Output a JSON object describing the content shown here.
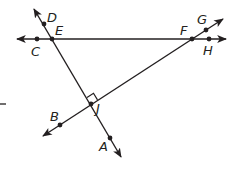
{
  "diagram": {
    "type": "geometry-lines",
    "colors": {
      "stroke": "#231f20",
      "background": "#ffffff"
    },
    "lines": [
      {
        "name": "line-CH",
        "through": [
          "C",
          "E",
          "F",
          "H"
        ],
        "arrows": "both"
      },
      {
        "name": "line-DA",
        "through": [
          "D",
          "E",
          "J",
          "A"
        ],
        "arrows": "both"
      },
      {
        "name": "line-BG",
        "through": [
          "B",
          "J",
          "F",
          "G"
        ],
        "arrows": "both"
      }
    ],
    "points": [
      {
        "label": "D",
        "x": 44,
        "y": 24
      },
      {
        "label": "E",
        "x": 52,
        "y": 39
      },
      {
        "label": "C",
        "x": 37,
        "y": 39
      },
      {
        "label": "F",
        "x": 192,
        "y": 39
      },
      {
        "label": "G",
        "x": 206,
        "y": 30
      },
      {
        "label": "H",
        "x": 209,
        "y": 39
      },
      {
        "label": "J",
        "x": 91,
        "y": 104
      },
      {
        "label": "B",
        "x": 60,
        "y": 125
      },
      {
        "label": "A",
        "x": 110,
        "y": 138
      }
    ],
    "right_angle_at": "J",
    "labels": {
      "D": "D",
      "E": "E",
      "C": "C",
      "F": "F",
      "G": "G",
      "H": "H",
      "J": "J",
      "B": "B",
      "A": "A"
    }
  }
}
